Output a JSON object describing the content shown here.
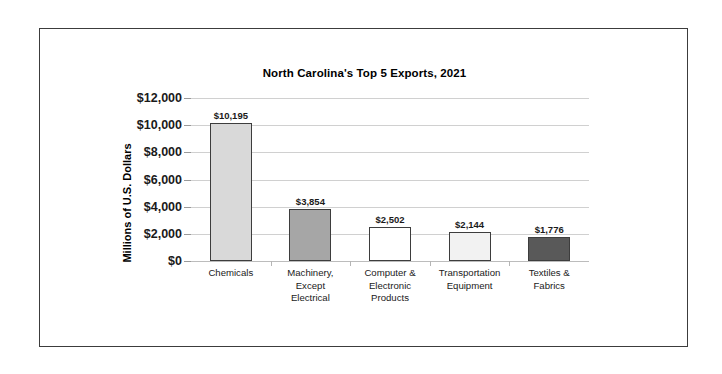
{
  "chart_data": {
    "type": "bar",
    "title": "North Carolina's Top 5 Exports, 2021",
    "xlabel": "",
    "ylabel": "Millions of U.S. Dollars",
    "categories": [
      "Chemicals",
      "Machinery, Except Electrical",
      "Computer & Electronic Products",
      "Transportation Equipment",
      "Textiles & Fabrics"
    ],
    "category_lines": [
      [
        "Chemicals"
      ],
      [
        "Machinery,",
        "Except",
        "Electrical"
      ],
      [
        "Computer &",
        "Electronic",
        "Products"
      ],
      [
        "Transportation",
        "Equipment"
      ],
      [
        "Textiles &",
        "Fabrics"
      ]
    ],
    "values": [
      10195,
      3854,
      2502,
      2144,
      1776
    ],
    "value_labels": [
      "$10,195",
      "$3,854",
      "$2,502",
      "$2,144",
      "$1,776"
    ],
    "bar_colors": [
      "#d9d9d9",
      "#a6a6a6",
      "#ffffff",
      "#f2f2f2",
      "#595959"
    ],
    "bar_border_color": "#3d3d3d",
    "ylim": [
      0,
      12000
    ],
    "ytick_values": [
      12000,
      10000,
      8000,
      6000,
      4000,
      2000,
      0
    ],
    "ytick_labels": [
      "$12,000",
      "$10,000",
      "$8,000",
      "$6,000",
      "$4,000",
      "$2,000",
      "$0"
    ],
    "grid": true,
    "legend": false
  }
}
